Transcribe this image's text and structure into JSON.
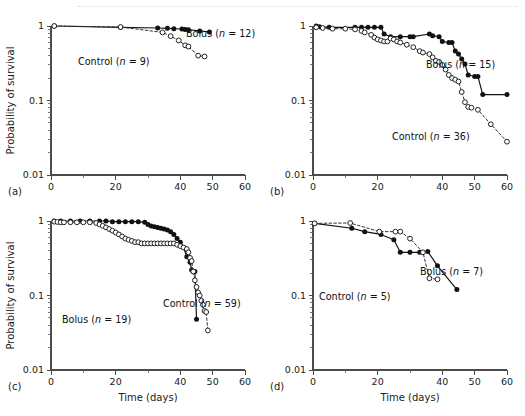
{
  "figure": {
    "panels": [
      {
        "letter": "(a)",
        "ylabel": "Probability of survival",
        "xlabel": "",
        "show_xlabel": false,
        "labels": [
          {
            "text": "Bolus (n = 12)",
            "prefix": "Bolus (",
            "ital": "n",
            "suffix": " = 12)"
          },
          {
            "text": "Control (n = 9)",
            "prefix": "Control (",
            "ital": "n",
            "suffix": " = 9)"
          }
        ]
      },
      {
        "letter": "(b)",
        "ylabel": "",
        "xlabel": "",
        "show_xlabel": false,
        "labels": [
          {
            "text": "Bolus (n = 15)",
            "prefix": "Bolus (",
            "ital": "n",
            "suffix": " = 15)"
          },
          {
            "text": "Control (n = 36)",
            "prefix": "Control (",
            "ital": "n",
            "suffix": " = 36)"
          }
        ]
      },
      {
        "letter": "(c)",
        "ylabel": "Probability of survival",
        "xlabel": "Time (days)",
        "show_xlabel": true,
        "labels": [
          {
            "text": "Bolus (n = 19)",
            "prefix": "Bolus (",
            "ital": "n",
            "suffix": " = 19)"
          },
          {
            "text": "Control (n = 59)",
            "prefix": "Control (",
            "ital": "n",
            "suffix": " = 59)"
          }
        ]
      },
      {
        "letter": "(d)",
        "ylabel": "",
        "xlabel": "Time (days)",
        "show_xlabel": true,
        "labels": [
          {
            "text": "Bolus (n = 7)",
            "prefix": "Bolus (",
            "ital": "n",
            "suffix": " = 7)"
          },
          {
            "text": "Control (n = 5)",
            "prefix": "Control (",
            "ital": "n",
            "suffix": " = 5)"
          }
        ]
      }
    ],
    "axis": {
      "y_ticklabels": [
        "1",
        "0.1",
        "0.01"
      ],
      "x_ticklabels": [
        "0",
        "20",
        "40",
        "50",
        "60"
      ]
    }
  },
  "chart_data": [
    {
      "panel": "(a)",
      "type": "line",
      "title": "",
      "xlabel": "Time (days)",
      "ylabel": "Probability of survival",
      "yscale": "log",
      "xlim": [
        0,
        60
      ],
      "ylim": [
        0.01,
        1
      ],
      "xticks": [
        0,
        10,
        20,
        30,
        40,
        50,
        60
      ],
      "xticklabels": [
        "0",
        "",
        "20",
        "",
        "40",
        "50",
        "60"
      ],
      "yticks": [
        1,
        0.1,
        0.01
      ],
      "yticklabels": [
        "1",
        "0.1",
        "0.01"
      ],
      "grid": false,
      "legend_position": "inline-annotation",
      "series": [
        {
          "name": "Bolus (n = 12)",
          "marker": "filled-circle",
          "linestyle": "solid",
          "n": 12,
          "x": [
            1,
            21.5,
            33,
            36,
            38,
            40.5,
            41.5,
            42.5,
            46,
            49
          ],
          "y": [
            1.0,
            0.96,
            0.94,
            0.93,
            0.92,
            0.91,
            0.9,
            0.89,
            0.86,
            0.83
          ]
        },
        {
          "name": "Control (n = 9)",
          "marker": "open-circle",
          "linestyle": "dashed",
          "n": 9,
          "x": [
            1,
            21.5,
            34.5,
            37,
            39.5,
            41.5,
            42.5,
            45.5,
            47.5
          ],
          "y": [
            1.0,
            0.97,
            0.82,
            0.73,
            0.64,
            0.55,
            0.53,
            0.4,
            0.39
          ]
        }
      ]
    },
    {
      "panel": "(b)",
      "type": "line",
      "title": "",
      "xlabel": "Time (days)",
      "ylabel": "Probability of survival",
      "yscale": "log",
      "xlim": [
        0,
        60
      ],
      "ylim": [
        0.01,
        1
      ],
      "xticks": [
        0,
        10,
        20,
        30,
        40,
        50,
        60
      ],
      "xticklabels": [
        "0",
        "",
        "20",
        "",
        "40",
        "50",
        "60"
      ],
      "yticks": [
        1,
        0.1,
        0.01
      ],
      "yticklabels": [
        "1",
        "0.1",
        "0.01"
      ],
      "grid": false,
      "legend_position": "inline-annotation",
      "series": [
        {
          "name": "Bolus (n = 15)",
          "marker": "filled-circle",
          "linestyle": "solid",
          "n": 15,
          "x": [
            1,
            2,
            5,
            13,
            15,
            17,
            19,
            21,
            22,
            24,
            27,
            30,
            31,
            36,
            37,
            39,
            40,
            42,
            43,
            44,
            45,
            46,
            47,
            48,
            50,
            51,
            52.5,
            60
          ],
          "y": [
            1.0,
            0.98,
            0.96,
            0.96,
            0.96,
            0.96,
            0.96,
            0.96,
            0.78,
            0.72,
            0.72,
            0.72,
            0.72,
            0.78,
            0.74,
            0.72,
            0.62,
            0.6,
            0.6,
            0.46,
            0.42,
            0.36,
            0.31,
            0.22,
            0.21,
            0.21,
            0.12,
            0.12
          ]
        },
        {
          "name": "Control (n = 36)",
          "marker": "open-circle",
          "linestyle": "dashed",
          "n": 36,
          "x": [
            1,
            3,
            6,
            10,
            13,
            15,
            16,
            18,
            19,
            20,
            21,
            22,
            23,
            24,
            25,
            26,
            27,
            29,
            31,
            33,
            34,
            36,
            37,
            38,
            39,
            40,
            41,
            42,
            43,
            44,
            45,
            46,
            47,
            48,
            49,
            51,
            55,
            60
          ],
          "y": [
            0.96,
            0.94,
            0.92,
            0.92,
            0.9,
            0.86,
            0.82,
            0.76,
            0.7,
            0.66,
            0.64,
            0.62,
            0.62,
            0.68,
            0.66,
            0.62,
            0.6,
            0.56,
            0.52,
            0.46,
            0.44,
            0.42,
            0.38,
            0.34,
            0.33,
            0.3,
            0.26,
            0.22,
            0.2,
            0.19,
            0.18,
            0.13,
            0.095,
            0.082,
            0.08,
            0.075,
            0.048,
            0.028
          ]
        }
      ]
    },
    {
      "panel": "(c)",
      "type": "line",
      "title": "",
      "xlabel": "Time (days)",
      "ylabel": "Probability of survival",
      "yscale": "log",
      "xlim": [
        0,
        60
      ],
      "ylim": [
        0.01,
        1
      ],
      "xticks": [
        0,
        10,
        20,
        30,
        40,
        50,
        60
      ],
      "xticklabels": [
        "0",
        "",
        "20",
        "",
        "40",
        "50",
        "60"
      ],
      "yticks": [
        1,
        0.1,
        0.01
      ],
      "yticklabels": [
        "1",
        "0.1",
        "0.01"
      ],
      "grid": false,
      "legend_position": "inline-annotation",
      "series": [
        {
          "name": "Bolus (n = 19)",
          "marker": "filled-circle",
          "linestyle": "solid",
          "n": 19,
          "x": [
            1,
            3,
            6,
            9,
            12,
            15,
            17,
            19,
            21,
            23,
            25,
            27,
            29,
            30,
            31,
            32,
            33,
            34,
            35,
            36,
            37,
            38,
            39,
            40,
            41,
            42,
            43,
            43.5,
            44,
            44.5,
            45
          ],
          "y": [
            1.0,
            1.0,
            1.0,
            1.0,
            1.0,
            1.0,
            1.0,
            0.98,
            0.98,
            0.98,
            0.98,
            0.98,
            0.96,
            0.9,
            0.86,
            0.84,
            0.82,
            0.8,
            0.78,
            0.76,
            0.72,
            0.66,
            0.58,
            0.52,
            0.44,
            0.33,
            0.28,
            0.22,
            0.21,
            0.21,
            0.048
          ]
        },
        {
          "name": "Control (n = 59)",
          "marker": "open-circle",
          "linestyle": "dashed",
          "n": 59,
          "x": [
            1,
            2,
            3,
            4,
            6,
            8,
            10,
            12,
            14,
            15,
            16,
            17,
            18,
            19,
            20,
            21,
            22,
            23,
            24,
            25,
            26,
            27,
            28,
            29,
            30,
            31,
            32,
            33,
            34,
            35,
            36,
            37,
            38,
            39,
            40,
            41,
            42,
            42.5,
            43,
            43.5,
            44,
            44.5,
            45,
            45.5,
            46,
            46.5,
            47,
            47.5,
            48,
            48.5
          ],
          "y": [
            0.98,
            0.97,
            0.96,
            0.96,
            0.96,
            0.96,
            0.96,
            0.96,
            0.94,
            0.9,
            0.86,
            0.82,
            0.78,
            0.74,
            0.7,
            0.66,
            0.62,
            0.58,
            0.56,
            0.54,
            0.52,
            0.52,
            0.5,
            0.5,
            0.5,
            0.5,
            0.5,
            0.5,
            0.5,
            0.5,
            0.5,
            0.5,
            0.5,
            0.48,
            0.46,
            0.44,
            0.42,
            0.38,
            0.32,
            0.29,
            0.21,
            0.16,
            0.13,
            0.11,
            0.1,
            0.085,
            0.075,
            0.062,
            0.06,
            0.034
          ]
        }
      ]
    },
    {
      "panel": "(d)",
      "type": "line",
      "title": "",
      "xlabel": "Time (days)",
      "ylabel": "Probability of survival",
      "yscale": "log",
      "xlim": [
        0,
        60
      ],
      "ylim": [
        0.01,
        1
      ],
      "xticks": [
        0,
        10,
        20,
        30,
        40,
        50,
        60
      ],
      "xticklabels": [
        "0",
        "",
        "20",
        "",
        "40",
        "50",
        "60"
      ],
      "yticks": [
        1,
        0.1,
        0.01
      ],
      "yticklabels": [
        "1",
        "0.1",
        "0.01"
      ],
      "grid": false,
      "legend_position": "inline-annotation",
      "series": [
        {
          "name": "Bolus (n = 7)",
          "marker": "filled-circle",
          "linestyle": "solid",
          "n": 7,
          "x": [
            0.5,
            12,
            16,
            21,
            25,
            27,
            30,
            33,
            35.5,
            38.5,
            44.5
          ],
          "y": [
            0.93,
            0.8,
            0.72,
            0.66,
            0.56,
            0.38,
            0.38,
            0.38,
            0.39,
            0.25,
            0.12
          ]
        },
        {
          "name": "Control (n = 5)",
          "marker": "open-circle",
          "linestyle": "dashed",
          "n": 5,
          "x": [
            0.5,
            11.5,
            20.5,
            25.5,
            27,
            30,
            34,
            36,
            38.5
          ],
          "y": [
            0.93,
            0.94,
            0.72,
            0.72,
            0.72,
            0.58,
            0.38,
            0.17,
            0.165
          ]
        }
      ]
    }
  ]
}
